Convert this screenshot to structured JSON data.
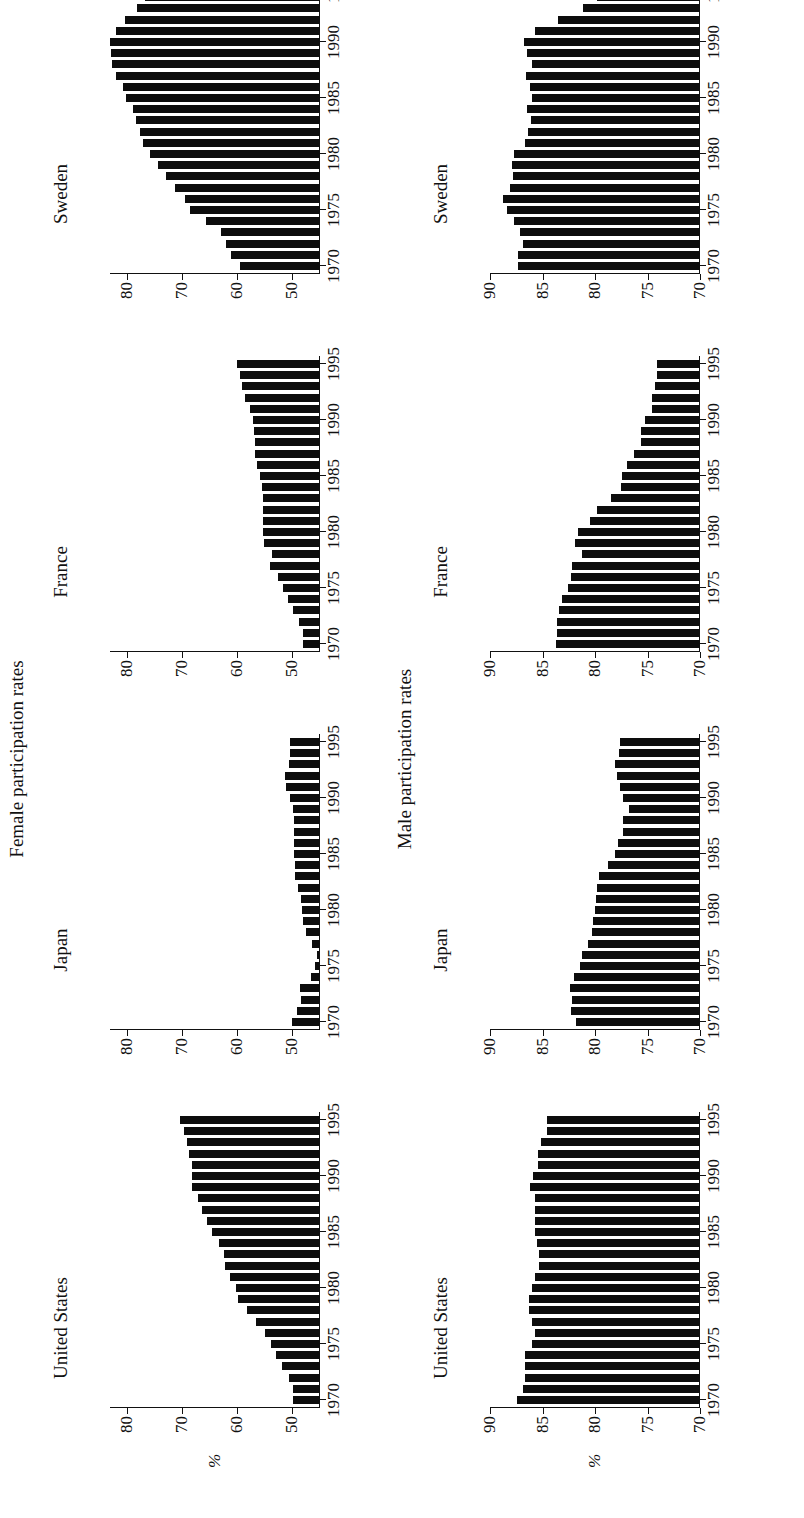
{
  "section_titles": {
    "female": "Female participation rates",
    "male": "Male participation rates"
  },
  "unit_label": "%",
  "chart_data": [
    {
      "type": "bar",
      "group": "Female participation rates",
      "title": "United States",
      "xlabel": "",
      "ylabel": "%",
      "ylim": [
        45,
        83
      ],
      "yticks": [
        50,
        60,
        70,
        80
      ],
      "xticks": [
        1970,
        1975,
        1980,
        1985,
        1990,
        1995
      ],
      "categories": [
        1970,
        1971,
        1972,
        1973,
        1974,
        1975,
        1976,
        1977,
        1978,
        1979,
        1980,
        1981,
        1982,
        1983,
        1984,
        1985,
        1986,
        1987,
        1988,
        1989,
        1990,
        1991,
        1992,
        1993,
        1994,
        1995
      ],
      "values": [
        49.8,
        49.8,
        50.6,
        51.8,
        53.0,
        53.9,
        55.0,
        56.5,
        58.3,
        59.8,
        60.2,
        61.2,
        62.2,
        62.4,
        63.3,
        64.5,
        65.4,
        66.3,
        67.0,
        68.2,
        68.2,
        68.2,
        68.7,
        69.0,
        69.6,
        70.3
      ]
    },
    {
      "type": "bar",
      "group": "Female participation rates",
      "title": "Japan",
      "xlabel": "",
      "ylabel": "%",
      "ylim": [
        45,
        83
      ],
      "yticks": [
        50,
        60,
        70,
        80
      ],
      "xticks": [
        1970,
        1975,
        1980,
        1985,
        1990,
        1995
      ],
      "categories": [
        1970,
        1971,
        1972,
        1973,
        1974,
        1975,
        1976,
        1977,
        1978,
        1979,
        1980,
        1981,
        1982,
        1983,
        1984,
        1985,
        1986,
        1987,
        1988,
        1989,
        1990,
        1991,
        1992,
        1993,
        1994,
        1995
      ],
      "values": [
        50.1,
        49.2,
        48.4,
        48.6,
        46.6,
        45.9,
        45.5,
        46.4,
        47.6,
        48.1,
        48.2,
        48.4,
        48.9,
        49.6,
        49.6,
        49.7,
        49.7,
        49.7,
        49.7,
        49.8,
        50.4,
        51.1,
        51.4,
        50.6,
        50.4,
        50.4
      ]
    },
    {
      "type": "bar",
      "group": "Female participation rates",
      "title": "France",
      "xlabel": "",
      "ylabel": "%",
      "ylim": [
        45,
        83
      ],
      "yticks": [
        50,
        60,
        70,
        80
      ],
      "xticks": [
        1970,
        1975,
        1980,
        1985,
        1990,
        1995
      ],
      "categories": [
        1970,
        1971,
        1972,
        1973,
        1974,
        1975,
        1976,
        1977,
        1978,
        1979,
        1980,
        1981,
        1982,
        1983,
        1984,
        1985,
        1986,
        1987,
        1988,
        1989,
        1990,
        1991,
        1992,
        1993,
        1994,
        1995
      ],
      "values": [
        48.0,
        48.0,
        48.8,
        49.8,
        50.8,
        51.7,
        52.6,
        54.0,
        53.7,
        55.1,
        55.3,
        55.3,
        55.3,
        55.3,
        55.5,
        55.8,
        56.4,
        56.8,
        56.8,
        57.0,
        57.2,
        57.6,
        58.6,
        59.2,
        59.5,
        60.0
      ]
    },
    {
      "type": "bar",
      "group": "Female participation rates",
      "title": "Sweden",
      "xlabel": "",
      "ylabel": "%",
      "ylim": [
        45,
        83
      ],
      "yticks": [
        50,
        60,
        70,
        80
      ],
      "xticks": [
        1970,
        1975,
        1980,
        1985,
        1990,
        1995
      ],
      "categories": [
        1970,
        1971,
        1972,
        1973,
        1974,
        1975,
        1976,
        1977,
        1978,
        1979,
        1980,
        1981,
        1982,
        1983,
        1984,
        1985,
        1986,
        1987,
        1988,
        1989,
        1990,
        1991,
        1992,
        1993,
        1994,
        1995
      ],
      "values": [
        59.4,
        61.1,
        62.0,
        63.0,
        65.6,
        68.6,
        69.5,
        71.2,
        72.8,
        74.3,
        75.7,
        77.0,
        77.6,
        78.3,
        78.9,
        80.1,
        80.6,
        81.9,
        82.6,
        82.8,
        83.0,
        82.0,
        80.3,
        78.1,
        76.6,
        76.8
      ]
    },
    {
      "type": "bar",
      "group": "Male participation rates",
      "title": "United States",
      "xlabel": "",
      "ylabel": "%",
      "ylim": [
        70,
        90
      ],
      "yticks": [
        70,
        75,
        80,
        85,
        90
      ],
      "xticks": [
        1970,
        1975,
        1980,
        1985,
        1990,
        1995
      ],
      "categories": [
        1970,
        1971,
        1972,
        1973,
        1974,
        1975,
        1976,
        1977,
        1978,
        1979,
        1980,
        1981,
        1982,
        1983,
        1984,
        1985,
        1986,
        1987,
        1988,
        1989,
        1990,
        1991,
        1992,
        1993,
        1994,
        1995
      ],
      "values": [
        87.4,
        86.9,
        86.7,
        86.7,
        86.7,
        86.0,
        85.7,
        86.0,
        86.3,
        86.3,
        86.0,
        85.7,
        85.3,
        85.3,
        85.5,
        85.7,
        85.7,
        85.7,
        85.7,
        86.2,
        85.9,
        85.4,
        85.4,
        85.1,
        84.6,
        84.6
      ]
    },
    {
      "type": "bar",
      "group": "Male participation rates",
      "title": "Japan",
      "xlabel": "",
      "ylabel": "%",
      "ylim": [
        70,
        90
      ],
      "yticks": [
        70,
        75,
        80,
        85,
        90
      ],
      "xticks": [
        1970,
        1975,
        1980,
        1985,
        1990,
        1995
      ],
      "categories": [
        1970,
        1971,
        1972,
        1973,
        1974,
        1975,
        1976,
        1977,
        1978,
        1979,
        1980,
        1981,
        1982,
        1983,
        1984,
        1985,
        1986,
        1987,
        1988,
        1989,
        1990,
        1991,
        1992,
        1993,
        1994,
        1995
      ],
      "values": [
        81.8,
        82.3,
        82.2,
        82.4,
        82.0,
        81.4,
        81.2,
        80.7,
        80.3,
        80.2,
        80.0,
        79.9,
        79.8,
        79.6,
        78.8,
        78.1,
        77.8,
        77.3,
        77.3,
        76.8,
        77.3,
        77.6,
        77.9,
        78.1,
        77.7,
        77.6
      ]
    },
    {
      "type": "bar",
      "group": "Male participation rates",
      "title": "France",
      "xlabel": "",
      "ylabel": "%",
      "ylim": [
        70,
        90
      ],
      "yticks": [
        70,
        75,
        80,
        85,
        90
      ],
      "xticks": [
        1970,
        1975,
        1980,
        1985,
        1990,
        1995
      ],
      "categories": [
        1970,
        1971,
        1972,
        1973,
        1974,
        1975,
        1976,
        1977,
        1978,
        1979,
        1980,
        1981,
        1982,
        1983,
        1984,
        1985,
        1986,
        1987,
        1988,
        1989,
        1990,
        1991,
        1992,
        1993,
        1994,
        1995
      ],
      "values": [
        83.7,
        83.6,
        83.6,
        83.4,
        83.1,
        82.6,
        82.3,
        82.2,
        81.2,
        81.9,
        81.6,
        80.5,
        79.8,
        78.5,
        77.5,
        77.4,
        77.0,
        76.3,
        75.6,
        75.6,
        75.2,
        74.6,
        74.6,
        74.3,
        74.1,
        74.1
      ]
    },
    {
      "type": "bar",
      "group": "Male participation rates",
      "title": "Sweden",
      "xlabel": "",
      "ylabel": "%",
      "ylim": [
        70,
        90
      ],
      "yticks": [
        70,
        75,
        80,
        85,
        90
      ],
      "xticks": [
        1970,
        1975,
        1980,
        1985,
        1990,
        1995
      ],
      "categories": [
        1970,
        1971,
        1972,
        1973,
        1974,
        1975,
        1976,
        1977,
        1978,
        1979,
        1980,
        1981,
        1982,
        1983,
        1984,
        1985,
        1986,
        1987,
        1988,
        1989,
        1990,
        1991,
        1992,
        1993,
        1994,
        1995
      ],
      "values": [
        87.3,
        87.3,
        86.9,
        87.1,
        87.7,
        88.4,
        88.8,
        88.1,
        87.8,
        87.9,
        87.7,
        86.7,
        86.4,
        86.1,
        86.5,
        86.0,
        86.2,
        86.6,
        86.0,
        86.5,
        86.8,
        85.7,
        83.5,
        81.1,
        79.8,
        80.4
      ]
    }
  ]
}
